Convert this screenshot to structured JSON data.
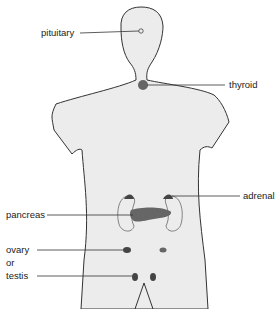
{
  "diagram": {
    "body_fill": "#ececec",
    "outline_color": "#333333",
    "gland_color": "#555555",
    "labels": {
      "pituitary": "pituitary",
      "thyroid": "thyroid",
      "adrenal": "adrenal",
      "pancreas": "pancreas",
      "ovary": "ovary",
      "or": "or",
      "testis": "testis"
    }
  }
}
